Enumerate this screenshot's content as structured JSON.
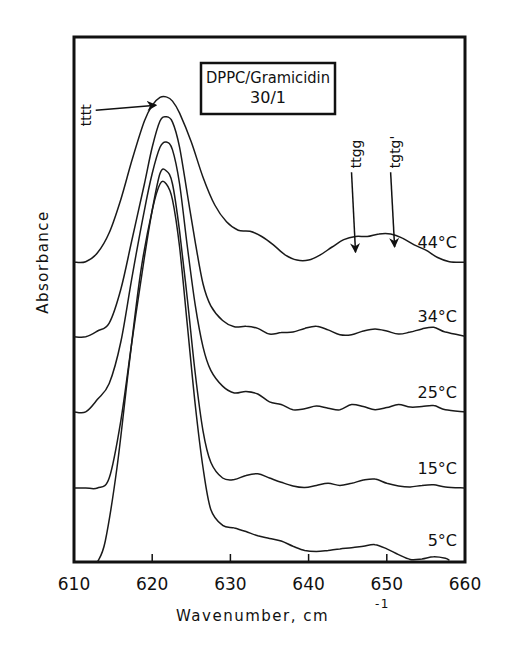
{
  "chart_data": {
    "type": "line",
    "title": "",
    "xlabel": "Wavenumber, cm",
    "xlabel_superscript": "-1",
    "ylabel": "Absorbance",
    "xlim": [
      610,
      660
    ],
    "ylim": [
      0,
      1
    ],
    "xticks": [
      610,
      620,
      630,
      640,
      650,
      660
    ],
    "yticks": [],
    "grid": false,
    "legend": "none",
    "inset_box": {
      "line1": "DPPC/Gramicidin",
      "line2": "30/1"
    },
    "annotations": [
      {
        "text": "tttt",
        "orientation": "vertical",
        "x": 611.5,
        "y": 0.83,
        "arrow_to": [
          620.5,
          0.87
        ]
      },
      {
        "text": "ttgg",
        "orientation": "vertical",
        "x": 646,
        "y": 0.75,
        "arrow_to": [
          646,
          0.59
        ]
      },
      {
        "text": "tgtg'",
        "orientation": "vertical",
        "x": 651,
        "y": 0.75,
        "arrow_to": [
          651,
          0.6
        ]
      }
    ],
    "series": [
      {
        "name": "44°C",
        "x": [
          610,
          611.5,
          613,
          614.5,
          616,
          617.5,
          619,
          620,
          621,
          621.8,
          622.6,
          623.5,
          625,
          626.5,
          628,
          629.5,
          631,
          632.5,
          634,
          635.5,
          637,
          638.5,
          640,
          641.5,
          643,
          644.5,
          646,
          647.5,
          649,
          650.5,
          652,
          653.5,
          655,
          656.5,
          658,
          660
        ],
        "values": [
          0.571,
          0.572,
          0.589,
          0.627,
          0.691,
          0.77,
          0.84,
          0.87,
          0.885,
          0.886,
          0.878,
          0.855,
          0.8,
          0.733,
          0.68,
          0.648,
          0.632,
          0.63,
          0.62,
          0.604,
          0.585,
          0.575,
          0.575,
          0.585,
          0.6,
          0.614,
          0.62,
          0.62,
          0.625,
          0.625,
          0.617,
          0.604,
          0.594,
          0.58,
          0.572,
          0.571
        ]
      },
      {
        "name": "34°C",
        "x": [
          610,
          611.5,
          613,
          614.5,
          616,
          617.5,
          619,
          620,
          621,
          621.8,
          622.6,
          623.5,
          624.5,
          625.5,
          626.5,
          627.5,
          629,
          630.5,
          632,
          633.5,
          635,
          636.5,
          638,
          639.5,
          641,
          642.5,
          644,
          645.5,
          647,
          648.5,
          650,
          651.5,
          653,
          654.5,
          656,
          657.5,
          660
        ],
        "values": [
          0.429,
          0.429,
          0.44,
          0.455,
          0.52,
          0.62,
          0.72,
          0.79,
          0.84,
          0.848,
          0.838,
          0.79,
          0.7,
          0.61,
          0.53,
          0.488,
          0.46,
          0.448,
          0.449,
          0.445,
          0.434,
          0.437,
          0.438,
          0.445,
          0.449,
          0.442,
          0.433,
          0.433,
          0.44,
          0.444,
          0.44,
          0.434,
          0.438,
          0.444,
          0.447,
          0.438,
          0.43
        ]
      },
      {
        "name": "25°C",
        "x": [
          610,
          611.5,
          613,
          614.5,
          616,
          617.5,
          619,
          620,
          621,
          621.8,
          622.6,
          623.5,
          624.5,
          625.5,
          626.5,
          627.5,
          629,
          630.5,
          632,
          633.5,
          635,
          636.5,
          638,
          639.5,
          641,
          642.5,
          644,
          645.5,
          647,
          648.5,
          650,
          651.5,
          653,
          654.5,
          656,
          657.5,
          660
        ],
        "values": [
          0.286,
          0.286,
          0.31,
          0.34,
          0.42,
          0.55,
          0.67,
          0.74,
          0.79,
          0.8,
          0.785,
          0.72,
          0.6,
          0.49,
          0.41,
          0.365,
          0.335,
          0.322,
          0.325,
          0.32,
          0.305,
          0.3,
          0.29,
          0.292,
          0.297,
          0.293,
          0.29,
          0.3,
          0.296,
          0.29,
          0.294,
          0.3,
          0.295,
          0.296,
          0.298,
          0.29,
          0.286
        ]
      },
      {
        "name": "15°C",
        "x": [
          610,
          611.5,
          613,
          614.5,
          616,
          617.5,
          619,
          620,
          621,
          621.8,
          622.6,
          623.5,
          624.5,
          625.5,
          626.5,
          627.5,
          629,
          630.5,
          632,
          633.5,
          635,
          636.5,
          638,
          639.5,
          641,
          642.5,
          644,
          645.5,
          647,
          648.5,
          650,
          651.5,
          653,
          654.5,
          656,
          657.5,
          660
        ],
        "values": [
          0.141,
          0.141,
          0.141,
          0.16,
          0.27,
          0.43,
          0.58,
          0.67,
          0.74,
          0.745,
          0.72,
          0.63,
          0.5,
          0.36,
          0.25,
          0.19,
          0.16,
          0.157,
          0.165,
          0.168,
          0.16,
          0.152,
          0.145,
          0.142,
          0.146,
          0.15,
          0.146,
          0.15,
          0.156,
          0.158,
          0.15,
          0.145,
          0.143,
          0.146,
          0.147,
          0.143,
          0.141
        ]
      },
      {
        "name": "5°C",
        "x": [
          613,
          614,
          615.5,
          617,
          618.5,
          620,
          621,
          621.8,
          622.6,
          623.5,
          624.5,
          625.5,
          626.5,
          627.5,
          629,
          630.5,
          632,
          633.5,
          635,
          636.5,
          638,
          639.5,
          641,
          642.5,
          644,
          645.5,
          647,
          648.5,
          650,
          651.5,
          653,
          654.5,
          656,
          657.5,
          658
        ],
        "values": [
          0.0,
          0.04,
          0.18,
          0.37,
          0.55,
          0.67,
          0.72,
          0.72,
          0.69,
          0.6,
          0.45,
          0.3,
          0.18,
          0.1,
          0.07,
          0.065,
          0.058,
          0.05,
          0.045,
          0.04,
          0.03,
          0.022,
          0.02,
          0.022,
          0.025,
          0.027,
          0.03,
          0.033,
          0.025,
          0.014,
          0.005,
          0.006,
          0.01,
          0.007,
          0.003
        ]
      }
    ]
  }
}
